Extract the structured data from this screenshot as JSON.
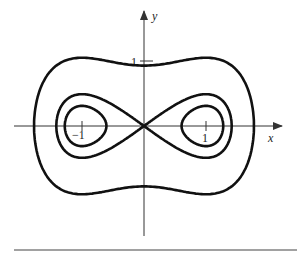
{
  "figure": {
    "title": "",
    "axis_x_label": "x",
    "axis_y_label": "y",
    "tick_labels": {
      "x_neg": "−1",
      "x_pos": "1",
      "y_pos": "1"
    },
    "curve_color": "#111111",
    "axis_color": "#333333"
  },
  "chart_data": {
    "type": "line",
    "xlabel": "x",
    "ylabel": "y",
    "xticks": [
      -1,
      1
    ],
    "yticks": [
      1
    ],
    "xlim": [
      -2.1,
      2.2
    ],
    "ylim": [
      -1.7,
      1.8
    ],
    "grid": false,
    "series": [
      {
        "name": "inner loops (c = -0.15)",
        "level": -0.15
      },
      {
        "name": "figure-eight separatrix (c = 0)",
        "level": 0
      },
      {
        "name": "outer curve (c = 0.9)",
        "level": 0.9
      }
    ]
  }
}
